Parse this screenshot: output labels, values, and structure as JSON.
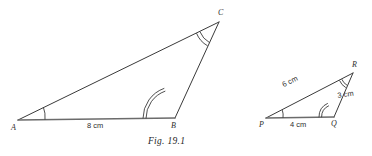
{
  "figure": {
    "caption": "Fig. 19.1",
    "triangles": [
      {
        "name": "triangle-abc",
        "vertices": [
          {
            "label": "A",
            "x": 14,
            "y": 124
          },
          {
            "label": "B",
            "x": 172,
            "y": 121
          },
          {
            "label": "C",
            "x": 218,
            "y": 16
          }
        ],
        "sides": [
          {
            "label": "8 cm",
            "from": "A",
            "to": "B"
          }
        ],
        "angle_marks": [
          {
            "vertex": "A",
            "arcs": 1
          },
          {
            "vertex": "B",
            "arcs": 2
          },
          {
            "vertex": "C",
            "arcs": 2
          }
        ]
      },
      {
        "name": "triangle-pqr",
        "vertices": [
          {
            "label": "P",
            "x": 262,
            "y": 122
          },
          {
            "label": "Q",
            "x": 332,
            "y": 121
          },
          {
            "label": "R",
            "x": 352,
            "y": 68
          }
        ],
        "sides": [
          {
            "label": "4 cm",
            "from": "P",
            "to": "Q"
          },
          {
            "label": "6 cm",
            "from": "P",
            "to": "R"
          },
          {
            "label": "3 cm",
            "from": "Q",
            "to": "R"
          }
        ],
        "angle_marks": [
          {
            "vertex": "P",
            "arcs": 1
          },
          {
            "vertex": "Q",
            "arcs": 2
          },
          {
            "vertex": "R",
            "arcs": 2
          }
        ]
      }
    ],
    "labels": {
      "a": "A",
      "b": "B",
      "c": "C",
      "p": "P",
      "q": "Q",
      "r": "R",
      "side_ab": "8 cm",
      "side_pq": "4 cm",
      "side_pr": "6 cm",
      "side_qr": "3 cm"
    },
    "colors": {
      "stroke": "#3a3a3a",
      "baseline": "#6b6b6b",
      "text": "#2e2e2e",
      "background": "#ffffff"
    }
  }
}
